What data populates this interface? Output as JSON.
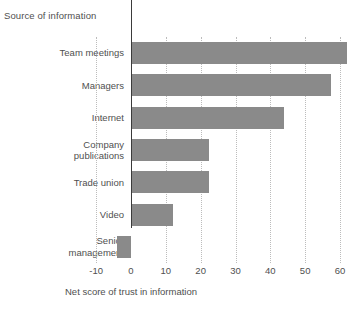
{
  "chart_data": {
    "type": "bar",
    "orientation": "horizontal",
    "title": "",
    "categories": [
      "Team meetings",
      "Managers",
      "Internet",
      "Company publications",
      "Trade union",
      "Video",
      "Senior management"
    ],
    "values": [
      62,
      57.5,
      44,
      22.5,
      22.5,
      12,
      -4
    ],
    "xlabel": "Net score of trust in information",
    "ylabel": "Source of information",
    "xlim": [
      -10,
      63
    ],
    "xticks": [
      -10,
      0,
      10,
      20,
      30,
      40,
      50,
      60
    ],
    "xticklabels": [
      "-10",
      "0",
      "10",
      "20",
      "30",
      "40",
      "50",
      "60"
    ],
    "grid": true,
    "grid_axis": "x",
    "grid_style": "dotted",
    "legend": false,
    "colors": {
      "bar": "#8a8a8a",
      "axis": "#3b3b3b",
      "gridline": "#bcbcbc",
      "text": "#4f4f4f",
      "background": "#ffffff"
    }
  },
  "axis_titles": {
    "category": "Source of information",
    "value": "Net score of trust in information"
  }
}
